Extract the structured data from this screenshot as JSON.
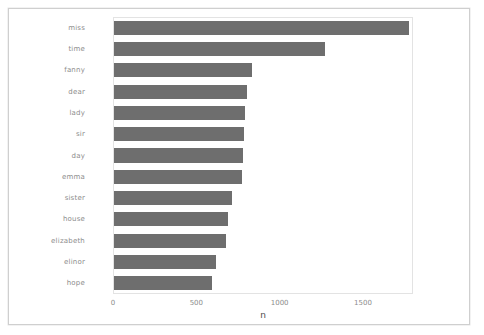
{
  "figure": {
    "background_color": "#ffffff",
    "frame_color": "#cfcfcf",
    "panel_color": "#ffffff",
    "bar_color": "#6e6e6e",
    "tick_label_color": "#8c8c8c",
    "axis_title_color": "#4d4d4d"
  },
  "chart_data": {
    "type": "bar",
    "orientation": "horizontal",
    "title": "",
    "subtitle": "",
    "xlabel": "n",
    "ylabel": "",
    "xlim": [
      0,
      1800
    ],
    "xticks": [
      0,
      500,
      1000,
      1500
    ],
    "xtick_labels": [
      "0",
      "500",
      "1000",
      "1500"
    ],
    "grid": false,
    "legend": "none",
    "categories": [
      "miss",
      "time",
      "fanny",
      "dear",
      "lady",
      "sir",
      "day",
      "emma",
      "sister",
      "house",
      "elizabeth",
      "elinor",
      "hope"
    ],
    "values": [
      1770,
      1265,
      825,
      795,
      785,
      780,
      775,
      765,
      710,
      685,
      670,
      610,
      590
    ],
    "bar_color": "#6e6e6e"
  }
}
